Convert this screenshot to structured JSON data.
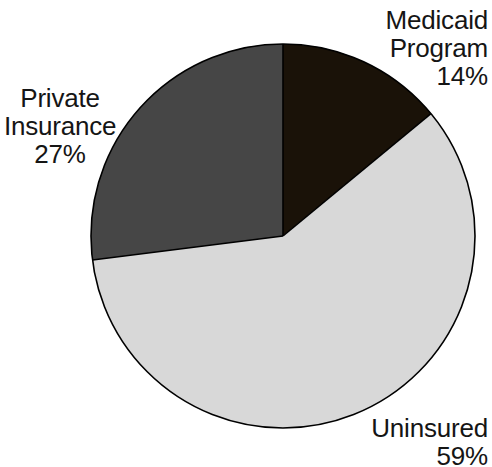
{
  "chart_data": {
    "type": "pie",
    "title": "",
    "subtitle": "",
    "xlabel": "",
    "ylabel": "",
    "legend_position": "none",
    "grid": false,
    "units": "percent",
    "start_angle_deg": 0,
    "direction": "clockwise",
    "categories": [
      "Medicaid Program",
      "Uninsured",
      "Private Insurance"
    ],
    "values": [
      14,
      59,
      27
    ],
    "slices": [
      {
        "name": "Medicaid Program",
        "value": 14,
        "value_label": "14%",
        "color": "#1a1208",
        "start_angle_deg": 0,
        "end_angle_deg": 50.4,
        "label_lines": [
          "Medicaid",
          "Program",
          "14%"
        ],
        "label_position": "upper-right"
      },
      {
        "name": "Uninsured",
        "value": 59,
        "value_label": "59%",
        "color": "#d8d8d8",
        "start_angle_deg": 50.4,
        "end_angle_deg": 262.8,
        "label_lines": [
          "Uninsured",
          "59%"
        ],
        "label_position": "lower-right"
      },
      {
        "name": "Private Insurance",
        "value": 27,
        "value_label": "27%",
        "color": "#464646",
        "start_angle_deg": 262.8,
        "end_angle_deg": 360,
        "label_lines": [
          "Private",
          "Insurance",
          "27%"
        ],
        "label_position": "mid-left"
      }
    ]
  },
  "labels": {
    "medicaid": {
      "line1": "Medicaid",
      "line2": "Program",
      "line3": "14%"
    },
    "private": {
      "line1": "Private",
      "line2": "Insurance",
      "line3": "27%"
    },
    "uninsured": {
      "line1": "Uninsured",
      "line2": "59%"
    }
  },
  "geometry": {
    "center_x": 283,
    "center_y": 236,
    "radius": 192,
    "outline_color": "#000000",
    "outline_width": 1.6,
    "background": "#ffffff"
  },
  "colors": {
    "medicaid": "#1a1208",
    "uninsured": "#d8d8d8",
    "private": "#464646",
    "background": "#ffffff",
    "text": "#151515",
    "outline": "#000000"
  }
}
